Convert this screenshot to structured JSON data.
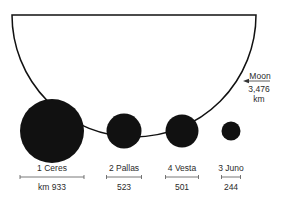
{
  "moon": {
    "label": "Moon",
    "diameter": "3,476",
    "unit": "km",
    "diameter_km": 3476
  },
  "asteroids": [
    {
      "name": "1 Ceres",
      "diameter_label": "km 933",
      "diameter_km": 933,
      "cx": 52,
      "r": 32
    },
    {
      "name": "2 Pallas",
      "diameter_label": "523",
      "diameter_km": 523,
      "cx": 124,
      "r": 17.5
    },
    {
      "name": "4 Vesta",
      "diameter_label": "501",
      "diameter_km": 501,
      "cx": 182,
      "r": 16.5
    },
    {
      "name": "3 Juno",
      "diameter_label": "244",
      "diameter_km": 244,
      "cx": 231,
      "r": 9.5
    }
  ],
  "colors": {
    "ink": "#111111",
    "text": "#2a2a2a",
    "scale": "#555555"
  }
}
